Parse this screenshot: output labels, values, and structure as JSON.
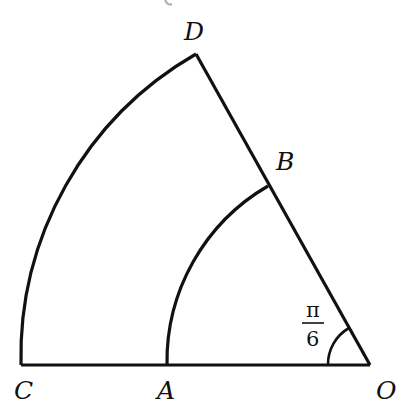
{
  "diagram": {
    "type": "annular-sector",
    "labels": {
      "D": "D",
      "B": "B",
      "C": "C",
      "A": "A",
      "O": "O"
    },
    "angle_label": {
      "numerator": "π",
      "denominator": "6"
    },
    "points": {
      "O": [
        370,
        365
      ],
      "C": [
        21,
        365
      ],
      "A": [
        167,
        365
      ],
      "D": [
        196,
        54
      ],
      "B": [
        268,
        186
      ]
    },
    "stroke_color": "#111111",
    "background": "#ffffff"
  }
}
